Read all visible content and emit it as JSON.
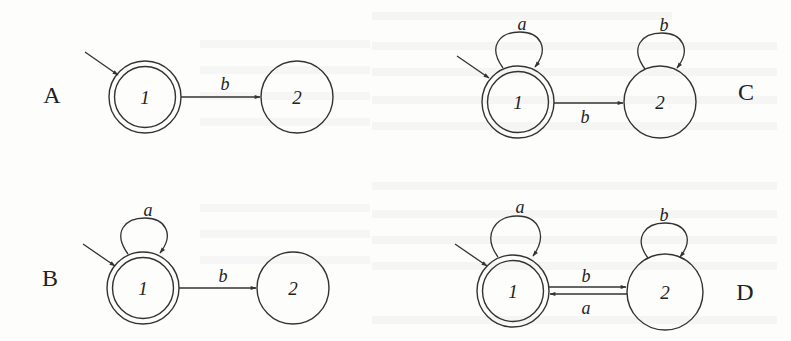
{
  "colors": {
    "ink": "#333333",
    "background": "#fdfdfc",
    "bleed_through": "#e4e4e4"
  },
  "panels": [
    {
      "id": "A",
      "label": "A",
      "states": [
        {
          "name": "1",
          "accepting": true,
          "start": true
        },
        {
          "name": "2",
          "accepting": false,
          "start": false
        }
      ],
      "transitions": [
        {
          "from": "1",
          "to": "2",
          "symbol": "b"
        }
      ]
    },
    {
      "id": "B",
      "label": "B",
      "states": [
        {
          "name": "1",
          "accepting": true,
          "start": true
        },
        {
          "name": "2",
          "accepting": false,
          "start": false
        }
      ],
      "transitions": [
        {
          "from": "1",
          "to": "1",
          "symbol": "a"
        },
        {
          "from": "1",
          "to": "2",
          "symbol": "b"
        }
      ]
    },
    {
      "id": "C",
      "label": "C",
      "states": [
        {
          "name": "1",
          "accepting": true,
          "start": true
        },
        {
          "name": "2",
          "accepting": false,
          "start": false
        }
      ],
      "transitions": [
        {
          "from": "1",
          "to": "1",
          "symbol": "a"
        },
        {
          "from": "1",
          "to": "2",
          "symbol": "b"
        },
        {
          "from": "2",
          "to": "2",
          "symbol": "b"
        }
      ]
    },
    {
      "id": "D",
      "label": "D",
      "states": [
        {
          "name": "1",
          "accepting": true,
          "start": true
        },
        {
          "name": "2",
          "accepting": false,
          "start": false
        }
      ],
      "transitions": [
        {
          "from": "1",
          "to": "1",
          "symbol": "a"
        },
        {
          "from": "1",
          "to": "2",
          "symbol": "b"
        },
        {
          "from": "2",
          "to": "1",
          "symbol": "a"
        },
        {
          "from": "2",
          "to": "2",
          "symbol": "b"
        }
      ]
    }
  ]
}
